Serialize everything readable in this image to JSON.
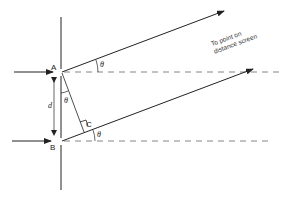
{
  "diagram": {
    "type": "double-slit path difference geometry",
    "points": {
      "A": "A",
      "B": "B",
      "C": "C"
    },
    "labels": {
      "separation": "d",
      "angle": "θ",
      "annotation_line1": "To point on",
      "annotation_line2": "distance screen"
    },
    "colors": {
      "line": "#222222",
      "dashed": "#555555",
      "background": "#ffffff"
    }
  }
}
